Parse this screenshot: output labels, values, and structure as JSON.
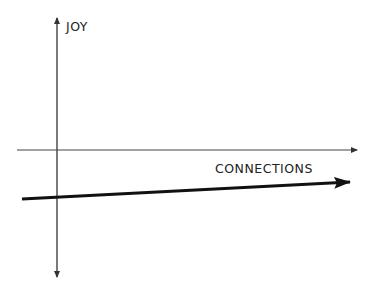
{
  "diagram": {
    "type": "axes-sketch",
    "y_axis_label": "JOY",
    "x_axis_label": "CONNECTIONS",
    "colors": {
      "axis": "#333333",
      "trend": "#111111",
      "background": "#ffffff"
    },
    "trend_line": {
      "from": [
        22,
        199
      ],
      "to": [
        350,
        182
      ],
      "direction": "slightly increasing"
    }
  }
}
